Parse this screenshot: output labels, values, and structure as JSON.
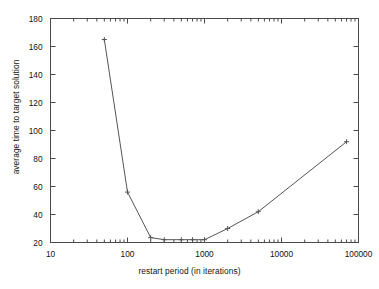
{
  "chart_data": {
    "type": "line",
    "title": "",
    "xlabel": "restart period (in iterations)",
    "ylabel": "average time to target solution",
    "xscale": "log",
    "yscale": "linear",
    "xlim": [
      10,
      100000
    ],
    "ylim": [
      20,
      180
    ],
    "grid": false,
    "legend": null,
    "marker": "plus",
    "line_color": "#555555",
    "x_tick_labels": [
      "10",
      "100",
      "1000",
      "10000",
      "100000"
    ],
    "x_tick_values": [
      10,
      100,
      1000,
      10000,
      100000
    ],
    "y_tick_labels": [
      "20",
      "40",
      "60",
      "80",
      "100",
      "120",
      "140",
      "160",
      "180"
    ],
    "y_tick_values": [
      20,
      40,
      60,
      80,
      100,
      120,
      140,
      160,
      180
    ],
    "x": [
      50,
      100,
      200,
      300,
      500,
      700,
      1000,
      2000,
      5000,
      70000
    ],
    "values": [
      165,
      56,
      23.5,
      22,
      22,
      22,
      22,
      30,
      42,
      92
    ],
    "series": [
      {
        "name": "average time to target solution",
        "x": [
          50,
          100,
          200,
          300,
          500,
          700,
          1000,
          2000,
          5000,
          70000
        ],
        "values": [
          165,
          56,
          23.5,
          22,
          22,
          22,
          22,
          30,
          42,
          92
        ]
      }
    ]
  },
  "axes": {
    "y_label": "average time to target solution",
    "x_label": "restart period (in iterations)"
  }
}
